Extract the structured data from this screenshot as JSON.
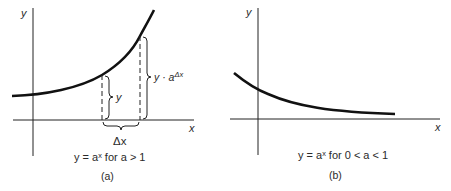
{
  "panels": [
    {
      "id": "a",
      "y_axis_label": "y",
      "x_axis_label": "x",
      "brace_y_label": "y",
      "brace_y_adx_label": "y · a",
      "brace_y_adx_exp": "Δx",
      "brace_dx_label": "Δx",
      "caption": "y = aˣ for a > 1",
      "tag": "(a)"
    },
    {
      "id": "b",
      "y_axis_label": "y",
      "x_axis_label": "x",
      "caption": "y = aˣ for 0 < a < 1",
      "tag": "(b)"
    }
  ],
  "colors": {
    "ink": "#1a1a1a",
    "background": "#ffffff"
  }
}
